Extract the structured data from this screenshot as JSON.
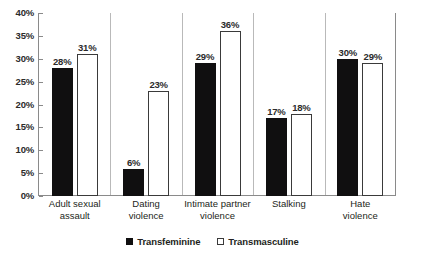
{
  "chart_data": {
    "type": "bar",
    "title": "",
    "subtitle": "",
    "xlabel": "",
    "ylabel": "",
    "ylim": [
      0,
      40
    ],
    "ytick_labels": [
      "0%",
      "5%",
      "10%",
      "15%",
      "20%",
      "25%",
      "30%",
      "35%",
      "40%"
    ],
    "ytick_values": [
      0,
      5,
      10,
      15,
      20,
      25,
      30,
      35,
      40
    ],
    "grid": false,
    "legend_position": "bottom",
    "categories": [
      "Adult sexual assault",
      "Dating violence",
      "Intimate partner violence",
      "Stalking",
      "Hate violence"
    ],
    "category_lines": [
      [
        "Adult sexual",
        "assault"
      ],
      [
        "Dating",
        "violence"
      ],
      [
        "Intimate partner",
        "violence"
      ],
      [
        "Stalking",
        ""
      ],
      [
        "Hate",
        "violence"
      ]
    ],
    "series": [
      {
        "name": "Transfeminine",
        "color": "#100f10",
        "style": "filled",
        "values": [
          28,
          6,
          29,
          17,
          30
        ],
        "labels": [
          "28%",
          "6%",
          "29%",
          "17%",
          "30%"
        ]
      },
      {
        "name": "Transmasculine",
        "color": "#ffffff",
        "style": "hollow",
        "values": [
          31,
          23,
          36,
          18,
          29
        ],
        "labels": [
          "31%",
          "23%",
          "36%",
          "18%",
          "29%"
        ]
      }
    ]
  },
  "legend": {
    "items": [
      {
        "label": "Transfeminine",
        "style": "filled"
      },
      {
        "label": "Transmasculine",
        "style": "hollow"
      }
    ]
  }
}
